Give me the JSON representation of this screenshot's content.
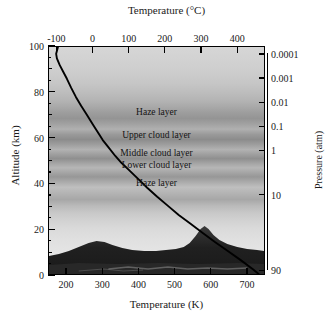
{
  "figure": {
    "top_axis_title": "Temperature (°C)",
    "bottom_axis_title": "Temperature (K)",
    "left_axis_title": "Altitude (km)",
    "right_axis_title": "Pressure (atm)"
  },
  "chart_data": {
    "type": "line",
    "title": "",
    "xlabel": "Temperature (K)",
    "ylabel": "Altitude (km)",
    "x2label": "Temperature (°C)",
    "y2label": "Pressure (atm)",
    "grid": false,
    "legend": "none",
    "xlim": [
      150,
      750
    ],
    "ylim": [
      0,
      100
    ],
    "x_ticks": [
      200,
      300,
      400,
      500,
      600,
      700
    ],
    "x_tick_labels": [
      "200",
      "300",
      "400",
      "500",
      "600",
      "700"
    ],
    "x2_ticks": [
      -100,
      0,
      100,
      200,
      300,
      400
    ],
    "x2_tick_labels": [
      "-100",
      "0",
      "100",
      "200",
      "300",
      "400"
    ],
    "y_ticks": [
      0,
      20,
      40,
      60,
      80,
      100
    ],
    "y_tick_labels": [
      "0",
      "20",
      "40",
      "60",
      "80",
      "100"
    ],
    "y_minor_ticks": [
      10,
      30,
      50,
      70,
      90
    ],
    "y2_scale": "log",
    "y2_tick_labels": [
      "0.0001",
      "0.001",
      "0.01",
      "0.1",
      "1",
      "10",
      "90"
    ],
    "y2_tick_altitudes_km": [
      96.5,
      86,
      75.5,
      65,
      54.5,
      35,
      2
    ],
    "series": [
      {
        "name": "Temperature profile",
        "color": "#000000",
        "points_t_k_vs_alt_km": [
          [
            175,
            100
          ],
          [
            170,
            97
          ],
          [
            172,
            95
          ],
          [
            180,
            92
          ],
          [
            190,
            89
          ],
          [
            200,
            86
          ],
          [
            212,
            82
          ],
          [
            225,
            78
          ],
          [
            240,
            74
          ],
          [
            256,
            70
          ],
          [
            272,
            66
          ],
          [
            288,
            62
          ],
          [
            300,
            59
          ],
          [
            315,
            56
          ],
          [
            335,
            52
          ],
          [
            352,
            49
          ],
          [
            372,
            46
          ],
          [
            398,
            42
          ],
          [
            424,
            38
          ],
          [
            452,
            34
          ],
          [
            482,
            30
          ],
          [
            512,
            26
          ],
          [
            546,
            22
          ],
          [
            580,
            18
          ],
          [
            614,
            14
          ],
          [
            650,
            10
          ],
          [
            686,
            6
          ],
          [
            720,
            2
          ],
          [
            735,
            0
          ]
        ]
      }
    ],
    "annotations": [
      {
        "label": "Haze layer",
        "altitude_km": 72
      },
      {
        "label": "Upper cloud layer",
        "altitude_km": 62
      },
      {
        "label": "Middle cloud layer",
        "altitude_km": 54
      },
      {
        "label": "Lower cloud layer",
        "altitude_km": 49
      },
      {
        "label": "Haze layer",
        "altitude_km": 42
      }
    ]
  }
}
